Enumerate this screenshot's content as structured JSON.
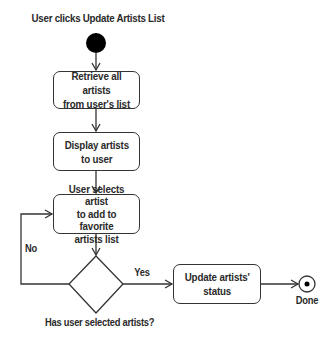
{
  "diagram": {
    "type": "uml-activity",
    "start_label": "User clicks Update Artists List",
    "activities": [
      {
        "id": "retrieve",
        "label": "Retrieve all artists\nfrom user's list"
      },
      {
        "id": "display",
        "label": "Display artists\nto user"
      },
      {
        "id": "select",
        "label": "User selects artist\nto add to favorite\nartists list"
      },
      {
        "id": "update",
        "label": "Update artists'\nstatus"
      }
    ],
    "decision": {
      "label": "Has user selected artists?",
      "yes_label": "Yes",
      "no_label": "No"
    },
    "end_label": "Done",
    "colors": {
      "stroke": "#333333",
      "fill": "#000000",
      "background": "#ffffff"
    }
  }
}
